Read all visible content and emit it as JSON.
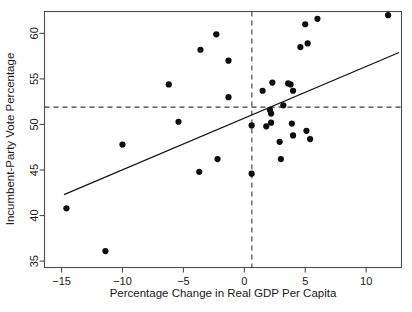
{
  "chart_data": {
    "type": "scatter",
    "title": "",
    "xlabel": "Percentage Change in Real GDP Per Capita",
    "ylabel": "Incumbent-Party Vote Percentage",
    "xlim": [
      -16.4,
      12.9
    ],
    "ylim": [
      34.3,
      62.4
    ],
    "grid": false,
    "legend": null,
    "xticks": [
      -15,
      -10,
      -5,
      0,
      5,
      10
    ],
    "xtick_labels": [
      "-15",
      "-10",
      "-5",
      "0",
      "5",
      "10"
    ],
    "yticks": [
      35,
      40,
      45,
      50,
      55,
      60
    ],
    "ytick_labels": [
      "35",
      "40",
      "45",
      "50",
      "55",
      "60"
    ],
    "points": [
      {
        "x": -14.6,
        "y": 40.8
      },
      {
        "x": -11.4,
        "y": 36.1
      },
      {
        "x": -10.0,
        "y": 47.8
      },
      {
        "x": -6.2,
        "y": 54.4
      },
      {
        "x": -5.4,
        "y": 50.3
      },
      {
        "x": -3.7,
        "y": 44.8
      },
      {
        "x": -3.6,
        "y": 58.2
      },
      {
        "x": -2.3,
        "y": 59.9
      },
      {
        "x": -2.2,
        "y": 46.2
      },
      {
        "x": -1.3,
        "y": 57.0
      },
      {
        "x": -1.3,
        "y": 53.0
      },
      {
        "x": 0.6,
        "y": 49.9
      },
      {
        "x": 0.6,
        "y": 44.6
      },
      {
        "x": 1.5,
        "y": 53.7
      },
      {
        "x": 1.8,
        "y": 49.8
      },
      {
        "x": 2.1,
        "y": 51.6
      },
      {
        "x": 2.2,
        "y": 51.2
      },
      {
        "x": 2.2,
        "y": 50.2
      },
      {
        "x": 2.3,
        "y": 54.6
      },
      {
        "x": 2.9,
        "y": 48.1
      },
      {
        "x": 3.0,
        "y": 46.2
      },
      {
        "x": 3.2,
        "y": 52.1
      },
      {
        "x": 3.6,
        "y": 54.5
      },
      {
        "x": 3.8,
        "y": 54.4
      },
      {
        "x": 3.9,
        "y": 50.1
      },
      {
        "x": 4.0,
        "y": 48.8
      },
      {
        "x": 4.0,
        "y": 53.7
      },
      {
        "x": 4.6,
        "y": 58.5
      },
      {
        "x": 5.0,
        "y": 61.0
      },
      {
        "x": 5.1,
        "y": 49.3
      },
      {
        "x": 5.2,
        "y": 58.9
      },
      {
        "x": 5.4,
        "y": 48.4
      },
      {
        "x": 6.0,
        "y": 61.6
      },
      {
        "x": 11.8,
        "y": 62.0
      }
    ],
    "regression_line": {
      "x_start": -14.8,
      "y_start": 42.3,
      "x_end": 12.7,
      "y_end": 57.9
    },
    "reference_lines": [
      {
        "orientation": "vertical",
        "x": 0.62
      },
      {
        "orientation": "horizontal",
        "y": 51.9
      }
    ]
  },
  "colors": {
    "point": "#0d0d0d",
    "fit_line": "#141414",
    "reference_line": "#3a3a3a",
    "frame": "#4d4d4d",
    "background": "#ffffff",
    "text": "#1a1a1a"
  }
}
